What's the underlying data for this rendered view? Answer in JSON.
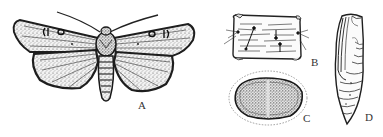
{
  "figure": {
    "panels": [
      {
        "id": "A",
        "label": "A",
        "subject": "adult moth, dorsal view, wings spread"
      },
      {
        "id": "B",
        "label": "B",
        "subject": "larval body segment with setae"
      },
      {
        "id": "C",
        "label": "C",
        "subject": "cross-section / egg top view, stippled"
      },
      {
        "id": "D",
        "label": "D",
        "subject": "pupa, lateral view"
      }
    ],
    "colors": {
      "ink": "#2a2a2a",
      "paper": "#ffffff",
      "stipple": "#5a5a5a"
    }
  }
}
